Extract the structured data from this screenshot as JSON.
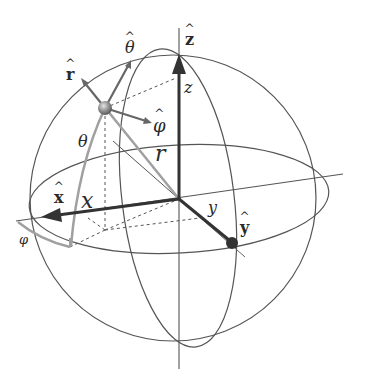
{
  "figure": {
    "colors": {
      "background": "#ffffff",
      "sphere_lines": "#555555",
      "axis_dark": "#333333",
      "vector_gray": "#9a9a9a",
      "unit_vector": "#6a6a6a",
      "point": "#888888"
    },
    "labels": {
      "z_hat": "z",
      "x_hat": "x",
      "y_hat": "y",
      "r_hat": "r",
      "theta_hat": "θ",
      "phi_hat": "φ",
      "z": "z",
      "x": "x",
      "y": "y",
      "r": "r",
      "theta": "θ",
      "phi": "φ"
    },
    "icons": {
      "point": "sphere-point-icon",
      "x_arrow": "arrow-left-icon",
      "z_arrow": "arrow-up-icon",
      "y_arrow": "ball-arrow-icon"
    }
  }
}
